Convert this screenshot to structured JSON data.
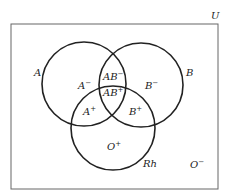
{
  "diagram": {
    "type": "venn",
    "universe_label": "U",
    "sets": [
      {
        "name": "A",
        "label": "A"
      },
      {
        "name": "B",
        "label": "B"
      },
      {
        "name": "Rh",
        "label": "Rh"
      }
    ],
    "regions": {
      "a_only": {
        "base": "A",
        "sign": "−"
      },
      "b_only": {
        "base": "B",
        "sign": "−"
      },
      "ab_top": {
        "base": "AB",
        "sign": "−"
      },
      "ab_center": {
        "base": "AB",
        "sign": "+"
      },
      "a_rh": {
        "base": "A",
        "sign": "+"
      },
      "b_rh": {
        "base": "B",
        "sign": "+"
      },
      "rh_only": {
        "base": "O",
        "sign": "+"
      },
      "outside": {
        "base": "O",
        "sign": "−"
      }
    },
    "colors": {
      "stroke": "#222222",
      "frame": "#555555",
      "background": "#ffffff"
    }
  }
}
